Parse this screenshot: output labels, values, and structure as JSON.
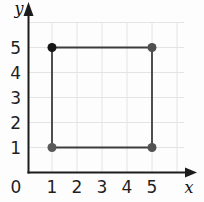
{
  "chart_data": {
    "type": "scatter",
    "xlabel": "x",
    "ylabel": "y",
    "xlim": [
      0,
      6.6
    ],
    "ylim": [
      0,
      6.6
    ],
    "x_ticks": [
      0,
      1,
      2,
      3,
      4,
      5
    ],
    "y_ticks": [
      1,
      2,
      3,
      4,
      5
    ],
    "grid": true,
    "grid_color": "#e4e4e4",
    "axis_color": "#1c1c1c",
    "tick_label_color": "#1f1f1f",
    "points": [
      {
        "x": 1,
        "y": 5,
        "color": "#161616"
      },
      {
        "x": 5,
        "y": 5,
        "color": "#4f4f4f"
      },
      {
        "x": 1,
        "y": 1,
        "color": "#5a5a5a"
      },
      {
        "x": 5,
        "y": 1,
        "color": "#525252"
      }
    ],
    "shape": {
      "type": "polygon",
      "vertices": [
        [
          1,
          1
        ],
        [
          1,
          5
        ],
        [
          5,
          5
        ],
        [
          5,
          1
        ]
      ],
      "stroke": "#3d3d3d",
      "fill": "none"
    }
  }
}
